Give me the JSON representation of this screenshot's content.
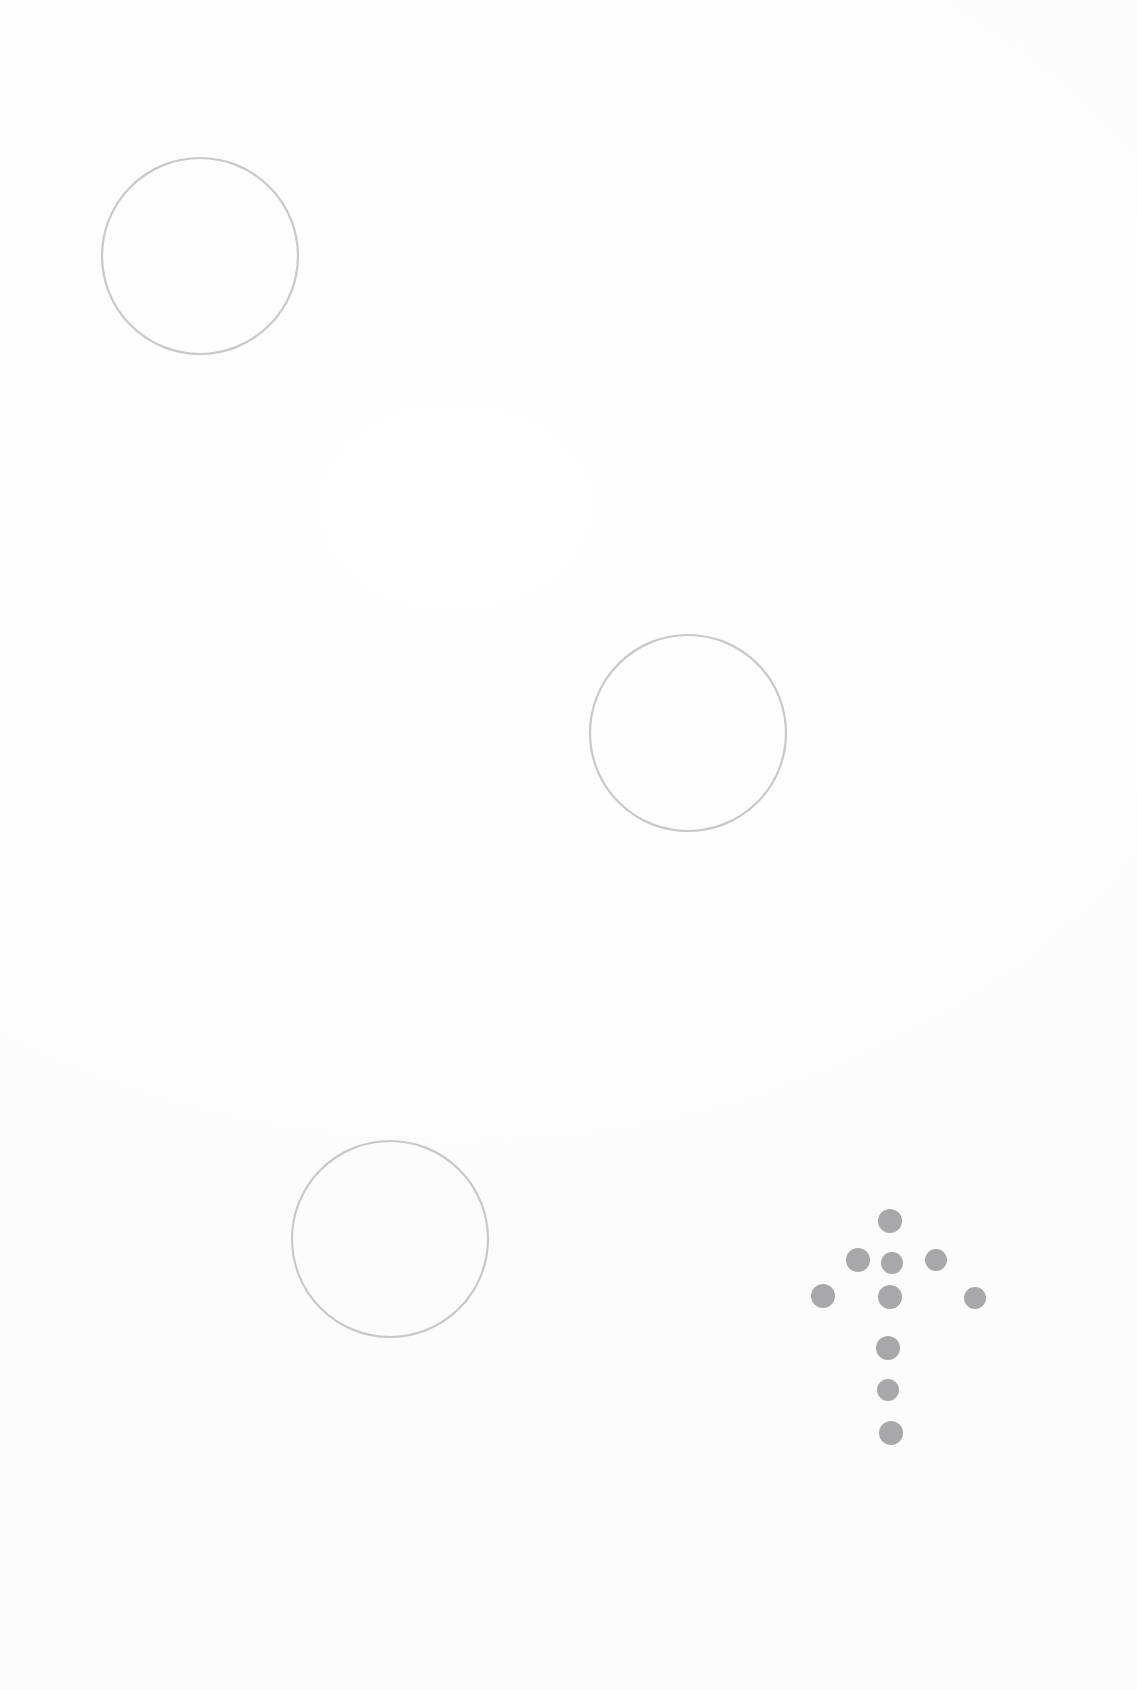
{
  "page": {
    "width": 1137,
    "height": 1690,
    "background_color": "#fefefe",
    "paper_tone": "#fcfcfc"
  },
  "palette": {
    "circle_stroke": "#c9c9cb",
    "dot_fill": "#a8a8aa",
    "background": "#ffffff"
  },
  "chart_data": {
    "type": "scatter",
    "title": "",
    "xlabel": "",
    "ylabel": "",
    "xlim": [
      0,
      1137
    ],
    "ylim": [
      0,
      1690
    ],
    "grid": false,
    "legend": "none",
    "series": [
      {
        "name": "outlined-circles",
        "marker": "open-circle",
        "color": "#c9c9cb",
        "stroke_width": 2.2,
        "points": [
          {
            "x": 200,
            "y": 256,
            "r": 98
          },
          {
            "x": 688,
            "y": 733,
            "r": 98
          },
          {
            "x": 390,
            "y": 1239,
            "r": 98
          }
        ]
      },
      {
        "name": "dot-arrow-cluster",
        "marker": "filled-circle",
        "color": "#a8a8aa",
        "points": [
          {
            "x": 890,
            "y": 1221,
            "r": 12
          },
          {
            "x": 858,
            "y": 1260,
            "r": 12
          },
          {
            "x": 892,
            "y": 1263,
            "r": 11
          },
          {
            "x": 936,
            "y": 1260,
            "r": 11
          },
          {
            "x": 823,
            "y": 1296,
            "r": 12
          },
          {
            "x": 890,
            "y": 1297,
            "r": 12
          },
          {
            "x": 975,
            "y": 1298,
            "r": 11
          },
          {
            "x": 888,
            "y": 1348,
            "r": 12
          },
          {
            "x": 888,
            "y": 1390,
            "r": 11
          },
          {
            "x": 891,
            "y": 1433,
            "r": 12
          }
        ]
      }
    ]
  },
  "shapes": {
    "circles": [
      {
        "id": "circle-top-left",
        "cx": 200,
        "cy": 256,
        "r": 98
      },
      {
        "id": "circle-middle-right",
        "cx": 688,
        "cy": 733,
        "r": 98
      },
      {
        "id": "circle-bottom-left",
        "cx": 390,
        "cy": 1239,
        "r": 98
      }
    ],
    "dots": [
      {
        "id": "dot-arrow-tip",
        "cx": 890,
        "cy": 1221,
        "r": 12
      },
      {
        "id": "dot-head-left",
        "cx": 858,
        "cy": 1260,
        "r": 12
      },
      {
        "id": "dot-head-center",
        "cx": 892,
        "cy": 1263,
        "r": 11
      },
      {
        "id": "dot-head-right",
        "cx": 936,
        "cy": 1260,
        "r": 11
      },
      {
        "id": "dot-wing-left",
        "cx": 823,
        "cy": 1296,
        "r": 12
      },
      {
        "id": "dot-shaft-top",
        "cx": 890,
        "cy": 1297,
        "r": 12
      },
      {
        "id": "dot-wing-right",
        "cx": 975,
        "cy": 1298,
        "r": 11
      },
      {
        "id": "dot-shaft-upper",
        "cx": 888,
        "cy": 1348,
        "r": 12
      },
      {
        "id": "dot-shaft-lower",
        "cx": 888,
        "cy": 1390,
        "r": 11
      },
      {
        "id": "dot-shaft-bottom",
        "cx": 891,
        "cy": 1433,
        "r": 12
      }
    ]
  },
  "labels": {
    "alt_description": "Three light gray outlined circles and a cluster of gray dots forming an upward arrow"
  }
}
